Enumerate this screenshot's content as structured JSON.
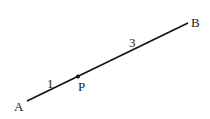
{
  "diagram": {
    "segment": {
      "from": "A",
      "to": "B"
    },
    "points": {
      "A": {
        "label": "A"
      },
      "P": {
        "label": "P"
      },
      "B": {
        "label": "B"
      }
    },
    "ratio_labels": {
      "AP": "1",
      "PB": "3"
    },
    "line_color": "#111111"
  }
}
